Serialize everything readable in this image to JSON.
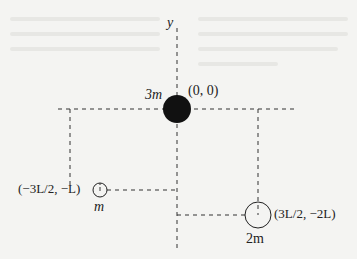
{
  "diagram": {
    "axis": {
      "y_label": "y"
    },
    "masses": [
      {
        "id": "center",
        "mass_label": "3m",
        "coord_label": "(0, 0)",
        "filled": true
      },
      {
        "id": "left",
        "mass_label": "m",
        "coord_label": "(−3L/2, −L)",
        "filled": false
      },
      {
        "id": "right",
        "mass_label": "2m",
        "coord_label": "(3L/2, −2L)",
        "filled": false
      }
    ],
    "colors": {
      "ink": "#111111",
      "dash": "#333333",
      "background": "#f4f4f2"
    }
  }
}
